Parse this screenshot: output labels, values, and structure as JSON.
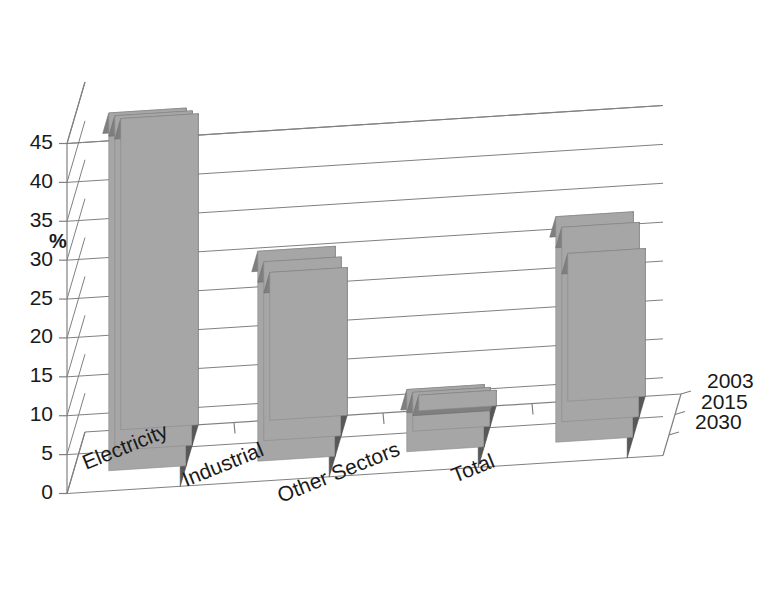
{
  "chart": {
    "type_label": "3d-clustered-column",
    "y_axis_title": "%",
    "background_color": "#ffffff",
    "bar_front_color": "#a6a6a6",
    "bar_side_color": "#585858",
    "bar_top_color": "#7f7f7f",
    "grid_color": "#808080",
    "text_color": "#1a1a1a"
  },
  "chart_data": {
    "type": "bar",
    "title": "",
    "subtitle": "",
    "xlabel": "",
    "ylabel": "%",
    "ylim": [
      0,
      45
    ],
    "yticks": [
      0,
      5,
      10,
      15,
      20,
      25,
      30,
      35,
      40,
      45
    ],
    "ytick_labels": [
      "0",
      "5",
      "10",
      "15",
      "20",
      "25",
      "30",
      "35",
      "40",
      "45"
    ],
    "grid": true,
    "grid_axis": "y",
    "legend": "depth-axis",
    "legend_position": "right",
    "three_d": true,
    "categories": [
      "Electricity",
      "Industrial",
      "Other Sectors",
      "Total"
    ],
    "series": [
      {
        "name": "2003",
        "values": [
          40,
          19,
          2,
          19
        ]
      },
      {
        "name": "2015",
        "values": [
          43,
          23,
          5,
          25
        ]
      },
      {
        "name": "2030",
        "values": [
          46,
          27,
          8,
          29
        ]
      }
    ]
  }
}
